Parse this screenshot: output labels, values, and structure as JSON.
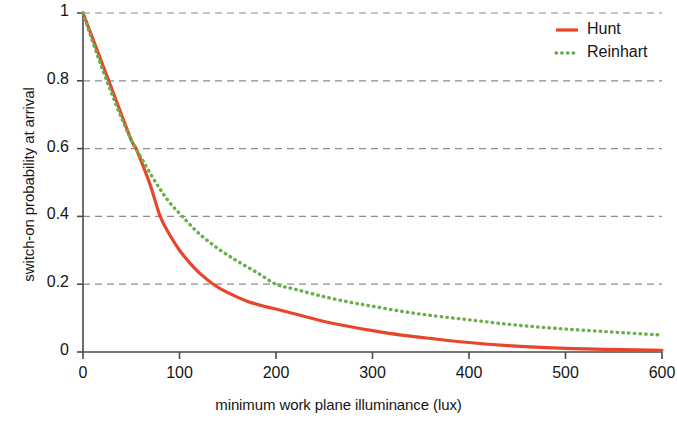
{
  "chart_data": {
    "type": "line",
    "title": "",
    "subtitle": "",
    "xlabel": "minimum work plane illuminance (lux)",
    "ylabel": "switch-on probability at arrival",
    "xlim": [
      0,
      600
    ],
    "ylim": [
      0,
      1
    ],
    "xticks": [
      0,
      100,
      200,
      300,
      400,
      500,
      600
    ],
    "xtick_labels": [
      "0",
      "100",
      "200",
      "300",
      "400",
      "500",
      "600"
    ],
    "yticks": [
      0,
      0.2,
      0.4,
      0.6,
      0.8,
      1
    ],
    "ytick_labels": [
      "0",
      "0.2",
      "0.4",
      "0.6",
      "0.8",
      "1"
    ],
    "grid": "horizontal-dashed",
    "grid_color": "#8c8c99",
    "legend_position": "top-right",
    "series": [
      {
        "name": "Hunt",
        "color": "#e8452a",
        "style": "solid",
        "x": [
          0,
          10,
          20,
          30,
          40,
          50,
          55,
          60,
          70,
          80,
          90,
          100,
          110,
          120,
          135,
          150,
          170,
          190,
          200,
          220,
          250,
          280,
          300,
          330,
          360,
          400,
          440,
          480,
          520,
          560,
          600
        ],
        "y": [
          1.0,
          0.925,
          0.85,
          0.775,
          0.7,
          0.625,
          0.6,
          0.565,
          0.49,
          0.4,
          0.345,
          0.3,
          0.265,
          0.235,
          0.2,
          0.175,
          0.15,
          0.133,
          0.127,
          0.112,
          0.09,
          0.073,
          0.063,
          0.05,
          0.04,
          0.028,
          0.019,
          0.013,
          0.009,
          0.007,
          0.005
        ]
      },
      {
        "name": "Reinhart",
        "color": "#6baf4a",
        "style": "dotted",
        "x": [
          0,
          10,
          20,
          30,
          40,
          50,
          55,
          60,
          70,
          80,
          90,
          103,
          120,
          140,
          160,
          180,
          200,
          220,
          250,
          280,
          300,
          330,
          360,
          400,
          440,
          480,
          520,
          560,
          600
        ],
        "y": [
          1.0,
          0.915,
          0.835,
          0.76,
          0.69,
          0.625,
          0.6,
          0.575,
          0.525,
          0.48,
          0.44,
          0.4,
          0.35,
          0.305,
          0.268,
          0.235,
          0.2,
          0.185,
          0.163,
          0.145,
          0.135,
          0.12,
          0.108,
          0.095,
          0.082,
          0.072,
          0.064,
          0.057,
          0.05
        ]
      }
    ]
  },
  "legend": {
    "entries": [
      {
        "label": "Hunt"
      },
      {
        "label": "Reinhart"
      }
    ]
  }
}
